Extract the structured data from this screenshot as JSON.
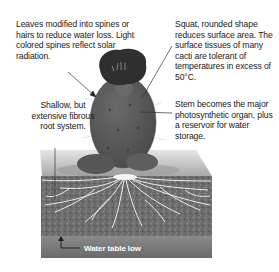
{
  "labels": {
    "leaves": "Leaves modified into spines or hairs to reduce water loss. Light colored spines reflect solar radiation.",
    "squat": "Squat, rounded shape reduces surface area. The surface tissues of many cacti are tolerant of temperatures in excess of 50°C.",
    "stem": "Stem becomes the major photosynthetic organ, plus a reservoir for water storage.",
    "roots": "Shallow, but extensive fibrous root system.",
    "water_table": "Water table low"
  },
  "colors": {
    "cactus_body": "#5a5a5a",
    "cactus_dark": "#2e2e2e",
    "soil": "#6e6e6e",
    "roots": "#f2f2f2",
    "ground_surface": "#bdbdbd",
    "water_band": "#8a8a8a"
  },
  "icons": {
    "water_table_arrow": "arrow-up-icon"
  }
}
